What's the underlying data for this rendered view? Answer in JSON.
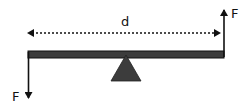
{
  "diagram": {
    "type": "lever-couple",
    "labels": {
      "distance": "d",
      "force_left": "F",
      "force_right": "F"
    },
    "colors": {
      "beam": "#3c3c3c",
      "fulcrum": "#3c3c3c",
      "line": "#111111"
    },
    "forces": [
      {
        "label": "F",
        "position": "left-end",
        "direction": "down"
      },
      {
        "label": "F",
        "position": "right-end",
        "direction": "up"
      }
    ],
    "dimension": {
      "label": "d",
      "spans": "left-end to right-end",
      "style": "dotted double-arrow"
    }
  }
}
